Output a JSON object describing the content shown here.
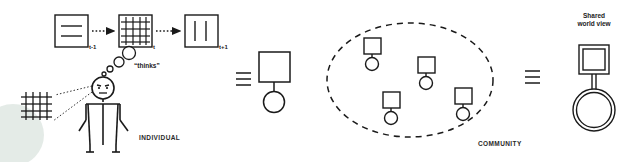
{
  "diagram": {
    "title_hidden": "",
    "type": "conceptual-diagram",
    "panels": [
      {
        "id": "individual",
        "caption": "INDIVIDUAL",
        "elements": {
          "timeline": {
            "steps": [
              {
                "label": "t-1",
                "content": "two-horizontal-lines"
              },
              {
                "label": "t",
                "content": "grid"
              },
              {
                "label": "t+1",
                "content": "two-vertical-lines"
              }
            ],
            "arrow_style": "dotted"
          },
          "thought": {
            "label": "“thinks”",
            "bubble_count": 4
          },
          "observed_grid": "grid",
          "figure": "stick-person"
        }
      },
      {
        "id": "individual-symbol",
        "equivalence": "≡",
        "symbol": "square-over-circle"
      },
      {
        "id": "community",
        "caption": "COMMUNITY",
        "boundary": "dashed-ellipse",
        "member_count": 4,
        "member_symbol": "square-over-circle"
      },
      {
        "id": "shared-world-view",
        "equivalence": "≡",
        "label_line1": "Shared",
        "label_line2": "world  view",
        "symbol": "double-square-over-double-circle"
      }
    ]
  },
  "colors": {
    "ink": "#1a1a1a",
    "background": "#ffffff",
    "watermark": "#dfe7e3"
  }
}
